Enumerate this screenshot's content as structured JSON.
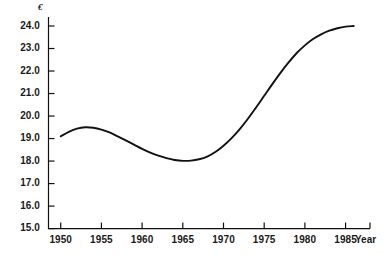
{
  "chart_data": {
    "type": "line",
    "title": "",
    "subtitle": "",
    "xlabel": "Year",
    "ylabel": "€",
    "y_unit_symbol": "€",
    "grid": false,
    "legend": null,
    "line_color": "#111111",
    "axis_color": "#111111",
    "background": "#ffffff",
    "xlim": [
      1948.5,
      1988.0
    ],
    "ylim": [
      15.0,
      24.4
    ],
    "xticks": [
      1950,
      1955,
      1960,
      1965,
      1970,
      1975,
      1980,
      1985
    ],
    "xtick_labels": [
      "1950",
      "1955",
      "1960",
      "1965",
      "1970",
      "1975",
      "1980",
      "1985"
    ],
    "yticks": [
      15.0,
      16.0,
      17.0,
      18.0,
      19.0,
      20.0,
      21.0,
      22.0,
      23.0,
      24.0
    ],
    "ytick_labels": [
      "15.0",
      "16.0",
      "17.0",
      "18.0",
      "19.0",
      "20.0",
      "21.0",
      "22.0",
      "23.0",
      "24.0"
    ],
    "series": [
      {
        "name": "value",
        "x": [
          1950,
          1951,
          1952,
          1953,
          1954,
          1955,
          1956,
          1957,
          1958,
          1959,
          1960,
          1961,
          1962,
          1963,
          1964,
          1965,
          1966,
          1967,
          1968,
          1969,
          1970,
          1971,
          1972,
          1973,
          1974,
          1975,
          1976,
          1977,
          1978,
          1979,
          1980,
          1981,
          1982,
          1983,
          1984,
          1985,
          1986
        ],
        "values": [
          19.1,
          19.3,
          19.44,
          19.5,
          19.48,
          19.4,
          19.27,
          19.1,
          18.92,
          18.73,
          18.54,
          18.38,
          18.24,
          18.13,
          18.05,
          18.01,
          18.02,
          18.08,
          18.2,
          18.4,
          18.68,
          19.02,
          19.42,
          19.88,
          20.38,
          20.9,
          21.42,
          21.92,
          22.38,
          22.8,
          23.14,
          23.42,
          23.63,
          23.79,
          23.9,
          23.97,
          24.0
        ]
      }
    ],
    "annotations": []
  },
  "axes": {
    "y_unit": "€",
    "x_name": "Year"
  }
}
